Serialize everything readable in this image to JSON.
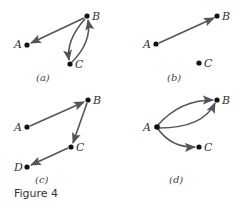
{
  "figure": {
    "caption": "Figure 4",
    "panels": [
      {
        "id": "a",
        "label": "(a)",
        "nodes": [
          "A",
          "B",
          "C"
        ],
        "edges": [
          {
            "from": "B",
            "to": "A",
            "style": "straight"
          },
          {
            "from": "B",
            "to": "C",
            "style": "curved-left"
          },
          {
            "from": "C",
            "to": "B",
            "style": "curved-right"
          }
        ]
      },
      {
        "id": "b",
        "label": "(b)",
        "nodes": [
          "A",
          "B",
          "C"
        ],
        "edges": [
          {
            "from": "A",
            "to": "B",
            "style": "straight"
          }
        ]
      },
      {
        "id": "c",
        "label": "(c)",
        "nodes": [
          "A",
          "B",
          "C",
          "D"
        ],
        "edges": [
          {
            "from": "A",
            "to": "B",
            "style": "straight"
          },
          {
            "from": "B",
            "to": "C",
            "style": "straight"
          },
          {
            "from": "C",
            "to": "D",
            "style": "straight"
          }
        ]
      },
      {
        "id": "d",
        "label": "(d)",
        "nodes": [
          "A",
          "B",
          "C"
        ],
        "edges": [
          {
            "from": "A",
            "to": "B",
            "style": "curved-up"
          },
          {
            "from": "A",
            "to": "B",
            "style": "curved-down"
          },
          {
            "from": "A",
            "to": "C",
            "style": "curved"
          }
        ]
      }
    ]
  },
  "colors": {
    "edge": "#555555",
    "node": "#111111",
    "text": "#333333"
  }
}
